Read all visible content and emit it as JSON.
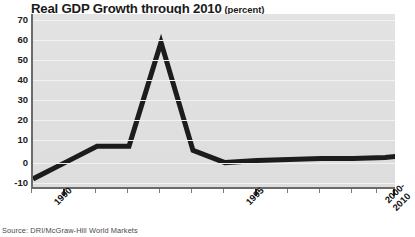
{
  "chart_data": {
    "type": "line",
    "title": "Real GDP Growth through 2010",
    "units": "(percent)",
    "xlabel": "",
    "ylabel": "",
    "ylim": [
      -10,
      70
    ],
    "ytick_labels": [
      "70",
      "60",
      "50",
      "40",
      "30",
      "20",
      "10",
      "0",
      "-10"
    ],
    "yticks": [
      70,
      60,
      50,
      40,
      30,
      20,
      10,
      0,
      -10
    ],
    "grid": true,
    "legend": "none",
    "xtick_labels": [
      "1990",
      "1995",
      "2000-\n2010"
    ],
    "x": [
      1988,
      1989,
      1990,
      1991,
      1992,
      1993,
      1994,
      1995,
      1996,
      1997,
      1998,
      1999,
      2000,
      2010
    ],
    "values": [
      -8,
      -4,
      0,
      8,
      8,
      59,
      6,
      0,
      1,
      1.5,
      2,
      2,
      2.5,
      3
    ],
    "series": [
      {
        "name": "Real GDP Growth",
        "color": "#1c1c1c",
        "values": [
          -8,
          -4,
          0,
          8,
          8,
          59,
          6,
          0,
          1,
          1.5,
          2,
          2,
          2.5,
          3
        ]
      }
    ],
    "peak": {
      "year": 1993,
      "value": 59
    },
    "source": "Source: DRI/McGraw-Hill World Markets"
  },
  "colors": {
    "line": "#1c1c1c",
    "plot_background": "#e0e0e0",
    "axis": "#6b6b6b",
    "gridline": "#f2f2f2",
    "text": "#1a1a1a"
  },
  "x_axis": {
    "tick_positions_px": [
      0,
      32,
      64,
      96,
      128,
      160,
      192,
      224,
      256,
      288,
      320,
      352,
      363
    ],
    "major_tick_indices": [
      1,
      7,
      12
    ],
    "labels": [
      {
        "text": "1990",
        "left": 34,
        "top": 196
      },
      {
        "text": "1995",
        "left": 226,
        "top": 196
      },
      {
        "text": "2000-",
        "top": 196,
        "left": 380,
        "line2": "2010"
      }
    ]
  }
}
